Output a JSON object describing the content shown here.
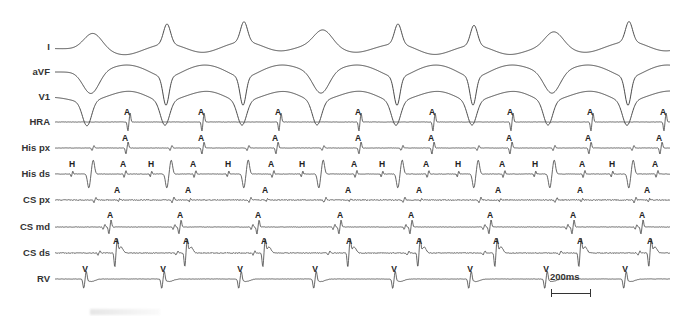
{
  "chart_data": {
    "type": "line",
    "title": "",
    "xlabel": "",
    "ylabel": "",
    "grid": false,
    "legend": "none",
    "scale_bar": {
      "label": "200ms",
      "x_start_px": 551,
      "x_end_px": 591,
      "ms": 200
    },
    "channels": [
      {
        "name": "I",
        "baseline_y": 47,
        "kind": "surface"
      },
      {
        "name": "aVF",
        "baseline_y": 72,
        "kind": "surface"
      },
      {
        "name": "V1",
        "baseline_y": 97,
        "kind": "surface"
      },
      {
        "name": "HRA",
        "baseline_y": 122,
        "kind": "intracardiac"
      },
      {
        "name": "His px",
        "baseline_y": 148,
        "kind": "intracardiac"
      },
      {
        "name": "His ds",
        "baseline_y": 174,
        "kind": "intracardiac"
      },
      {
        "name": "CS px",
        "baseline_y": 200,
        "kind": "intracardiac"
      },
      {
        "name": "CS md",
        "baseline_y": 227,
        "kind": "intracardiac"
      },
      {
        "name": "CS ds",
        "baseline_y": 253,
        "kind": "intracardiac"
      },
      {
        "name": "RV",
        "baseline_y": 279,
        "kind": "intracardiac"
      }
    ],
    "beats_v_x": [
      85,
      163,
      240,
      315,
      394,
      470,
      546,
      625
    ],
    "annotations": {
      "HRA": {
        "A": [
          127,
          201,
          278,
          358,
          432,
          510,
          590,
          663
        ]
      },
      "His px": {
        "A": [
          125,
          201,
          275,
          358,
          431,
          509,
          588,
          659
        ]
      },
      "His ds": {
        "H": [
          72,
          151,
          228,
          302,
          382,
          458,
          535,
          612
        ],
        "A": [
          123,
          193,
          271,
          354,
          426,
          502,
          582,
          655
        ]
      },
      "CS px": {
        "A": [
          117,
          188,
          265,
          348,
          419,
          498,
          580,
          647
        ]
      },
      "CS md": {
        "A": [
          110,
          180,
          258,
          340,
          411,
          490,
          573,
          642
        ]
      },
      "CS ds": {
        "A": [
          116,
          186,
          264,
          349,
          419,
          496,
          580,
          650
        ]
      },
      "RV": {
        "V": [
          85,
          163,
          240,
          315,
          394,
          470,
          546,
          625
        ]
      }
    },
    "surface_morphology": {
      "I": "alternating broad upright and narrow spiky upright complexes per beat",
      "aVF": "deep negative complexes, alternating broad/narrow",
      "V1": "deep negative QS complexes"
    },
    "x_range_px": [
      55,
      670
    ],
    "trace_color": "#4a4a4a"
  },
  "labels": {
    "channels": [
      "I",
      "aVF",
      "V1",
      "HRA",
      "His px",
      "His ds",
      "CS px",
      "CS md",
      "CS ds",
      "RV"
    ],
    "A": "A",
    "H": "H",
    "V": "V",
    "scale": "200ms"
  }
}
